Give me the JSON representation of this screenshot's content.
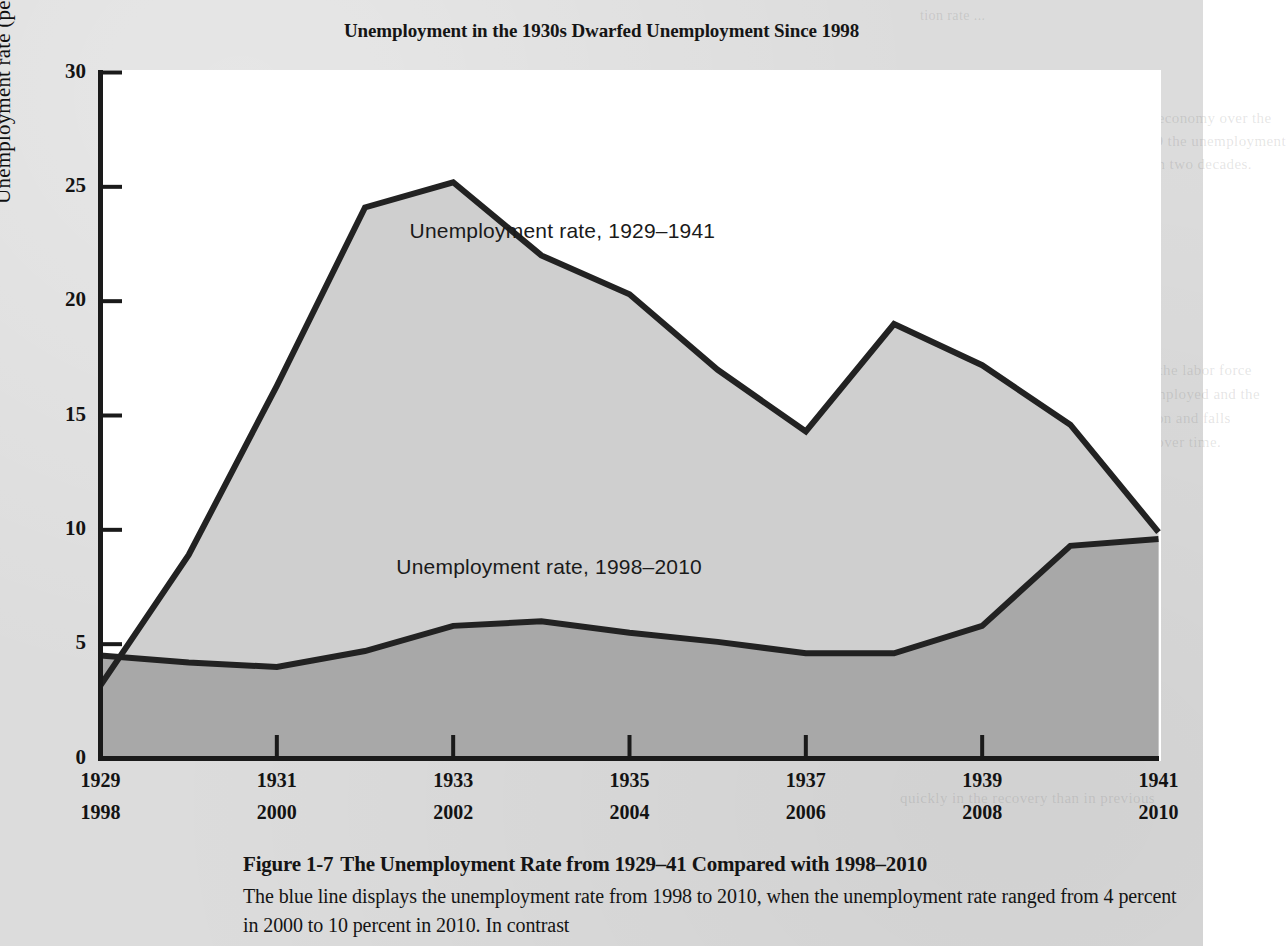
{
  "figure": {
    "title": "Unemployment in the 1930s Dwarfed Unemployment Since 1998",
    "caption_figure_label": "Figure 1-7",
    "caption_title": "The Unemployment Rate from 1929–41 Compared with 1998–2010",
    "caption_body": "The blue line displays the unemployment rate from 1998 to 2010, when the unemployment rate ranged from 4 percent in 2000 to 10 percent in 2010. In contrast"
  },
  "colors": {
    "page_background": "#dcdcdc",
    "plot_background": "#ffffff",
    "upper_series_fill": "#cfcfcf",
    "lower_series_fill": "#a8a8a8",
    "line_stroke": "#222222",
    "axis_stroke": "#1a1a1a",
    "text": "#141414"
  },
  "chart_data": {
    "type": "area",
    "title": "Unemployment in the 1930s Dwarfed Unemployment Since 1998",
    "xlabel": "",
    "ylabel": "Unemployment rate (percent)",
    "ylim": [
      0,
      30
    ],
    "yticks": [
      0,
      5,
      10,
      15,
      20,
      25,
      30
    ],
    "ytick_labels": [
      "0",
      "5",
      "10",
      "15",
      "20",
      "25",
      "30"
    ],
    "grid": false,
    "legend_position": "inline-annotation",
    "x_index": [
      0,
      1,
      2,
      3,
      4,
      5,
      6,
      7,
      8,
      9,
      10,
      11,
      12
    ],
    "x_axis_rows": [
      {
        "name": "1929-1941",
        "tick_labels": [
          "1929",
          "1931",
          "1933",
          "1935",
          "1937",
          "1939",
          "1941"
        ],
        "tick_index": [
          0,
          2,
          4,
          6,
          8,
          10,
          12
        ],
        "all_years": [
          1929,
          1930,
          1931,
          1932,
          1933,
          1934,
          1935,
          1936,
          1937,
          1938,
          1939,
          1940,
          1941
        ]
      },
      {
        "name": "1998-2010",
        "tick_labels": [
          "1998",
          "2000",
          "2002",
          "2004",
          "2006",
          "2008",
          "2010"
        ],
        "tick_index": [
          0,
          2,
          4,
          6,
          8,
          10,
          12
        ],
        "all_years": [
          1998,
          1999,
          2000,
          2001,
          2002,
          2003,
          2004,
          2005,
          2006,
          2007,
          2008,
          2009,
          2010
        ]
      }
    ],
    "series": [
      {
        "name": "Unemployment rate, 1929–1941",
        "annotation": "Unemployment rate, 1929–1941",
        "fill": "#cfcfcf",
        "stroke": "#222222",
        "values": [
          3.2,
          8.9,
          16.3,
          24.1,
          25.2,
          22.0,
          20.3,
          17.0,
          14.3,
          19.0,
          17.2,
          14.6,
          9.9
        ]
      },
      {
        "name": "Unemployment rate, 1998–2010",
        "annotation": "Unemployment rate, 1998–2010",
        "fill": "#a8a8a8",
        "stroke": "#222222",
        "values": [
          4.5,
          4.2,
          4.0,
          4.7,
          5.8,
          6.0,
          5.5,
          5.1,
          4.6,
          4.6,
          5.8,
          9.3,
          9.6
        ]
      }
    ],
    "annotations": [
      {
        "text": "Unemployment rate, 1929–1941",
        "x_index": 5.15,
        "y_value": 23.0
      },
      {
        "text": "Unemployment rate, 1998–2010",
        "x_index": 5.0,
        "y_value": 8.3
      }
    ]
  },
  "background_bleed_text": {
    "lines": [
      "tion  rate  ... ",
      "the  period  of  high  unemployment  in  the  economy  over  the",
      "the  period.  In  the  recession  of  2007-2009  the  unemployment",
      "rate  rose  to  the  highest  level  in  more  than  two  decades.",
      "The  Meaning  of  the  Data",
      "of  unemployment  measures  the  share  of  the  labor  force",
      "for  work.  The  labor  force  includes  the  employed  and  the",
      "the  unemployment  rate  rises  in  a  recession  and  falls",
      "measures  the  health  of  the  labor  market  over  time.",
      "only  part  of  the  picture  of  the  economy.",
      "quickly  in  the  recovery  than  in  previous"
    ]
  }
}
